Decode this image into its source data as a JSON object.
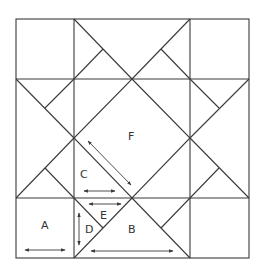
{
  "diagram": {
    "type": "quilt-block-pattern",
    "colors": {
      "line": "#3a3a3a",
      "background": "#ffffff",
      "text": "#333333"
    },
    "labels": {
      "A": "A",
      "B": "B",
      "C": "C",
      "D": "D",
      "E": "E",
      "F": "F"
    },
    "pieces": [
      {
        "id": "A",
        "shape": "corner square",
        "grain": "horizontal"
      },
      {
        "id": "B",
        "shape": "large triangle",
        "grain": "horizontal"
      },
      {
        "id": "C",
        "shape": "triangle",
        "grain": "horizontal"
      },
      {
        "id": "D",
        "shape": "small triangle",
        "grain": "vertical"
      },
      {
        "id": "E",
        "shape": "small triangle",
        "grain": "horizontal"
      },
      {
        "id": "F",
        "shape": "center square on point",
        "grain": "diagonal"
      }
    ]
  }
}
